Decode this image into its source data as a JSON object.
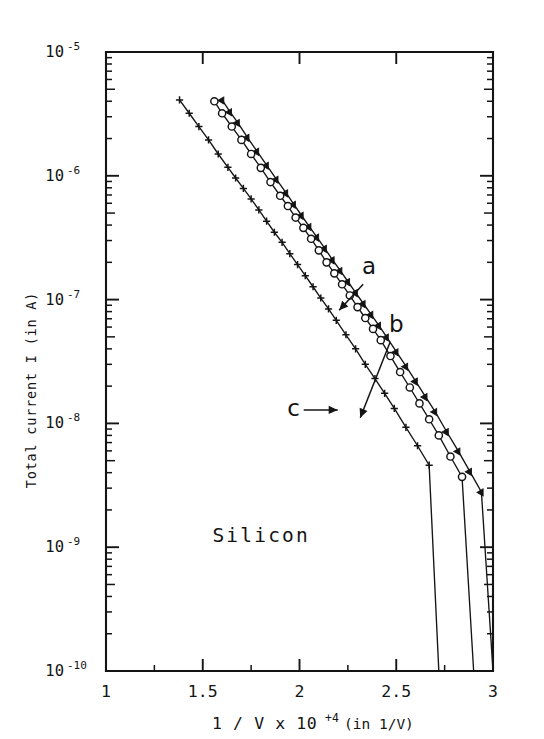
{
  "figure": {
    "name": "semi-log-current-vs-inverse-voltage",
    "sample_annotation": "Silicon",
    "background_color": "#ffffff",
    "ink_color": "#141414"
  },
  "chart_data": {
    "type": "line",
    "title": "",
    "subtitle": "",
    "annotations": [
      {
        "text": "Silicon",
        "x": 1.55,
        "y": 1.1e-09
      },
      {
        "text": "a",
        "x": 2.36,
        "y": 1.6e-07
      },
      {
        "text": "b",
        "x": 2.5,
        "y": 5.5e-08
      },
      {
        "text": "c",
        "x": 1.97,
        "y": 1.15e-08
      }
    ],
    "xlabel": "1 / V  x 10 +4   (in 1/V)",
    "xlabel_parts": {
      "main": "1 / V  x 10",
      "exponent": "+4",
      "unit": "(in 1/V)"
    },
    "ylabel": "Total current I   (in A)",
    "ylabel_parts": {
      "main": "Total current I",
      "unit": "(in A)"
    },
    "xscale": "linear",
    "yscale": "log",
    "xlim": [
      1,
      3
    ],
    "ylim": [
      1e-10,
      1e-05
    ],
    "x_major_ticks": [
      1,
      1.5,
      2,
      2.5,
      3
    ],
    "x_tick_labels": [
      "1",
      "1.5",
      "2",
      "2.5",
      "3"
    ],
    "x_minor_ticks": [
      1.25,
      1.75,
      2.25,
      2.75
    ],
    "y_major_ticks": [
      1e-05,
      1e-06,
      1e-07,
      1e-08,
      1e-09,
      1e-10
    ],
    "y_tick_labels": [
      "10 -5",
      "10 -6",
      "10 -7",
      "10 -8",
      "10 -9",
      "10 -10"
    ],
    "y_tick_mantissa": "10",
    "y_tick_exponents": [
      "-5",
      "-6",
      "-7",
      "-8",
      "-9",
      "-10"
    ],
    "grid": false,
    "legend_position": "inline-annotations",
    "series": [
      {
        "name": "a",
        "label": "a",
        "marker": "filled-triangle",
        "marker_color": "#141414",
        "line_color": "#141414",
        "x": [
          1.6,
          1.64,
          1.68,
          1.73,
          1.78,
          1.83,
          1.88,
          1.93,
          1.97,
          2.01,
          2.05,
          2.09,
          2.13,
          2.17,
          2.21,
          2.25,
          2.29,
          2.33,
          2.37,
          2.41,
          2.45,
          2.5,
          2.55,
          2.6,
          2.65,
          2.7,
          2.76,
          2.82,
          2.88,
          2.94,
          3.0
        ],
        "y": [
          4.1e-06,
          3.3e-06,
          2.7e-06,
          2.05e-06,
          1.58e-06,
          1.22e-06,
          9.4e-07,
          7.3e-07,
          5.9e-07,
          4.8e-07,
          3.9e-07,
          3.2e-07,
          2.6e-07,
          2.1e-07,
          1.72e-07,
          1.4e-07,
          1.14e-07,
          9.3e-08,
          7.6e-08,
          6.2e-08,
          5e-08,
          3.8e-08,
          2.9e-08,
          2.2e-08,
          1.65e-08,
          1.25e-08,
          8.6e-09,
          6e-09,
          4.1e-09,
          2.8e-09,
          1e-10
        ]
      },
      {
        "name": "b",
        "label": "b",
        "marker": "open-circle",
        "marker_color": "#141414",
        "line_color": "#141414",
        "x": [
          1.56,
          1.6,
          1.65,
          1.7,
          1.75,
          1.8,
          1.85,
          1.9,
          1.94,
          1.98,
          2.02,
          2.06,
          2.1,
          2.14,
          2.18,
          2.22,
          2.26,
          2.3,
          2.34,
          2.38,
          2.42,
          2.47,
          2.52,
          2.57,
          2.62,
          2.67,
          2.72,
          2.78,
          2.84,
          2.9
        ],
        "y": [
          4e-06,
          3.2e-06,
          2.5e-06,
          1.95e-06,
          1.5e-06,
          1.16e-06,
          8.9e-07,
          6.9e-07,
          5.7e-07,
          4.6e-07,
          3.8e-07,
          3.1e-07,
          2.5e-07,
          2e-07,
          1.63e-07,
          1.33e-07,
          1.08e-07,
          8.7e-08,
          7.1e-08,
          5.8e-08,
          4.7e-08,
          3.5e-08,
          2.6e-08,
          1.95e-08,
          1.45e-08,
          1.08e-08,
          8e-09,
          5.4e-09,
          3.7e-09,
          1e-10
        ]
      },
      {
        "name": "c",
        "label": "c",
        "marker": "plus",
        "marker_color": "#141414",
        "line_color": "#141414",
        "x": [
          1.38,
          1.43,
          1.48,
          1.53,
          1.58,
          1.63,
          1.67,
          1.71,
          1.75,
          1.79,
          1.83,
          1.87,
          1.91,
          1.95,
          1.99,
          2.03,
          2.07,
          2.11,
          2.15,
          2.19,
          2.24,
          2.29,
          2.34,
          2.39,
          2.44,
          2.49,
          2.55,
          2.61,
          2.67,
          2.72
        ],
        "y": [
          4.1e-06,
          3.2e-06,
          2.5e-06,
          1.95e-06,
          1.5e-06,
          1.17e-06,
          9.6e-07,
          7.9e-07,
          6.5e-07,
          5.3e-07,
          4.3e-07,
          3.5e-07,
          2.9e-07,
          2.35e-07,
          1.92e-07,
          1.56e-07,
          1.27e-07,
          1.03e-07,
          8.4e-08,
          6.8e-08,
          5.2e-08,
          4e-08,
          3e-08,
          2.3e-08,
          1.75e-08,
          1.32e-08,
          9.3e-09,
          6.6e-09,
          4.6e-09,
          1e-10
        ]
      }
    ]
  }
}
